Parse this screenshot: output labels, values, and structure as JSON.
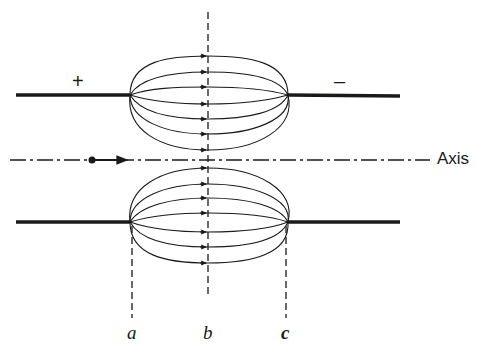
{
  "figure": {
    "plus_sign": "+",
    "minus_sign": "–",
    "axis_label": "Axis",
    "section_labels": {
      "a": "a",
      "b": "b",
      "c": "c"
    },
    "ink_color": "#1a1a1a",
    "background": "#ffffff"
  }
}
